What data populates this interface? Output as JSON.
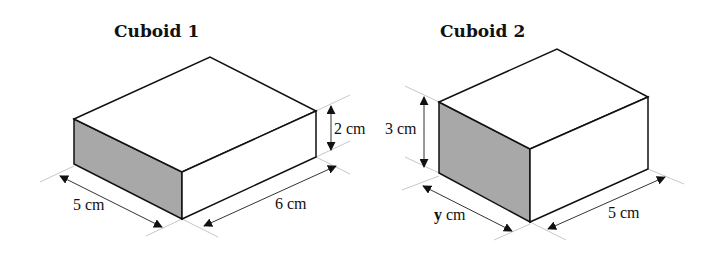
{
  "figure": {
    "type": "diagram",
    "colors": {
      "edge": "#111111",
      "shaded_face": "#a8a8a8",
      "extension_line": "#c8c8c8",
      "background": "#ffffff"
    }
  },
  "cuboids": [
    {
      "title": "Cuboid 1",
      "dimensions": {
        "width": {
          "value": "5",
          "unit": "cm",
          "label": "5 cm"
        },
        "length": {
          "value": "6",
          "unit": "cm",
          "label": "6 cm"
        },
        "height": {
          "value": "2",
          "unit": "cm",
          "label": "2 cm"
        }
      }
    },
    {
      "title": "Cuboid 2",
      "dimensions": {
        "width": {
          "value": "y",
          "unit": "cm",
          "var": "y",
          "unit_label": " cm"
        },
        "length": {
          "value": "5",
          "unit": "cm",
          "label": "5 cm"
        },
        "height": {
          "value": "3",
          "unit": "cm",
          "label": "3 cm"
        }
      }
    }
  ]
}
